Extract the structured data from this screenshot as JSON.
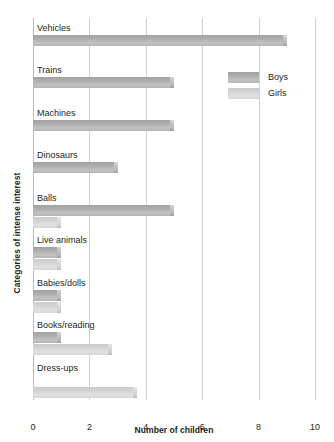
{
  "chart_data": {
    "type": "bar",
    "orientation": "horizontal",
    "title": "",
    "xlabel": "Number of children",
    "ylabel": "Categories of intense interest",
    "xlim": [
      0,
      10
    ],
    "xticks": [
      "0",
      "2",
      "4",
      "6",
      "8",
      "10"
    ],
    "grid": true,
    "legend_position": "upper-right",
    "categories": [
      "Vehicles",
      "Trains",
      "Machines",
      "Dinosaurs",
      "Balls",
      "Live animals",
      "Babies/dolls",
      "Books/reading",
      "Dress-ups"
    ],
    "series": [
      {
        "name": "Boys",
        "color": "#b0b0b0",
        "values": [
          9,
          5,
          5,
          3,
          5,
          1,
          1,
          1,
          0
        ]
      },
      {
        "name": "Girls",
        "color": "#d6d6d6",
        "values": [
          0,
          0,
          0,
          0,
          1,
          1,
          1,
          2.8,
          3.7
        ]
      }
    ]
  },
  "legend": {
    "entries": [
      {
        "label": "Boys",
        "color": "#b0b0b0"
      },
      {
        "label": "Girls",
        "color": "#d6d6d6"
      }
    ]
  }
}
